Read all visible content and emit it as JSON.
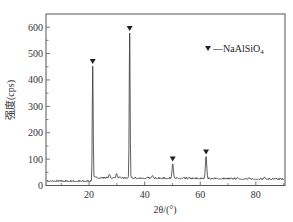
{
  "chart_data": {
    "type": "line",
    "title": "",
    "xlabel": "2θ/(°)",
    "ylabel": "强度(cps)",
    "xlim": [
      4.5,
      90.5
    ],
    "ylim": [
      0,
      650
    ],
    "x_ticks": [
      20,
      40,
      60,
      80
    ],
    "y_ticks": [
      0,
      100,
      200,
      300,
      400,
      500,
      600
    ],
    "y_minor_step": 50,
    "grid": false,
    "legend": {
      "position": "upper right",
      "entries": [
        {
          "marker": "down-triangle",
          "label": "—NaAlSiO",
          "subscript": "4",
          "full_label": "▼—NaAlSiO₄"
        }
      ]
    },
    "series": [
      {
        "name": "XRD pattern",
        "color": "#333333",
        "baseline_before_21": 15,
        "baseline_after_21": 28,
        "peaks": [
          {
            "x": 21.3,
            "y": 452,
            "marked": true
          },
          {
            "x": 27.3,
            "y": 42,
            "marked": false
          },
          {
            "x": 29.9,
            "y": 45,
            "marked": false
          },
          {
            "x": 34.6,
            "y": 578,
            "marked": true
          },
          {
            "x": 42.8,
            "y": 38,
            "marked": false
          },
          {
            "x": 50.1,
            "y": 82,
            "marked": true
          },
          {
            "x": 62.1,
            "y": 110,
            "marked": true
          },
          {
            "x": 73.5,
            "y": 30,
            "marked": false
          },
          {
            "x": 83.2,
            "y": 32,
            "marked": false
          }
        ]
      }
    ],
    "annotations": [
      {
        "type": "marker",
        "symbol": "▼",
        "x": 21.3,
        "y": 470
      },
      {
        "type": "marker",
        "symbol": "▼",
        "x": 34.6,
        "y": 595
      },
      {
        "type": "marker",
        "symbol": "▼",
        "x": 50.1,
        "y": 100
      },
      {
        "type": "marker",
        "symbol": "▼",
        "x": 62.1,
        "y": 127
      }
    ]
  }
}
